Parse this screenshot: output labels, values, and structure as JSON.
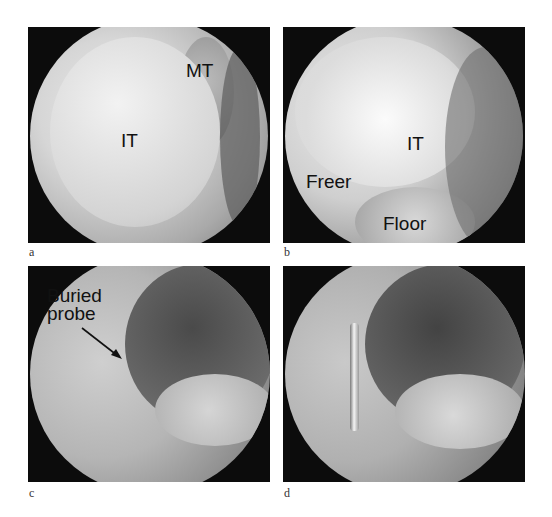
{
  "figure": {
    "panels": [
      {
        "id": "a",
        "letter": "a",
        "labels": {
          "inferior_turbinate": "IT",
          "middle_turbinate": "MT"
        }
      },
      {
        "id": "b",
        "letter": "b",
        "labels": {
          "inferior_turbinate": "IT",
          "instrument": "Freer",
          "floor": "Floor"
        }
      },
      {
        "id": "c",
        "letter": "c",
        "labels": {
          "annotation_line1": "Buried",
          "annotation_line2": "probe"
        }
      },
      {
        "id": "d",
        "letter": "d",
        "labels": {}
      }
    ]
  }
}
